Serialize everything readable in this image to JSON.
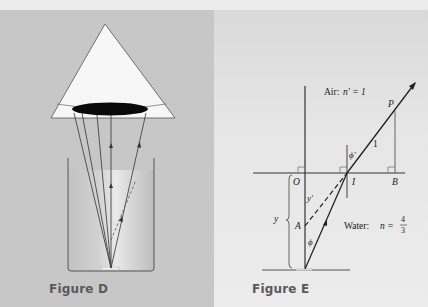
{
  "figures": [
    {
      "id": "D",
      "caption": "Figure D",
      "description": "Cone-shaped viewer over a beaker of water; rays from object at bottom refract at surface"
    },
    {
      "id": "E",
      "caption": "Figure E",
      "labels": {
        "air": "Air:",
        "air_index": "n′ = 1",
        "water": "Water:",
        "water_index_prefix": "n =",
        "water_index_num": "4",
        "water_index_den": "3",
        "point_P": "P",
        "point_O": "O",
        "point_I": "I",
        "point_B": "B",
        "point_A": "A",
        "segment_1": "1",
        "angle_phi": "ϕ",
        "angle_phi_prime": "ϕ′",
        "depth_y": "y",
        "depth_y_prime": "y′"
      }
    }
  ],
  "colors": {
    "background_left": "#c7c7c7",
    "background_right": "#e6e6e6",
    "top_strip": "#ececec",
    "line": "#333333",
    "caption": "#5a5a5a"
  }
}
